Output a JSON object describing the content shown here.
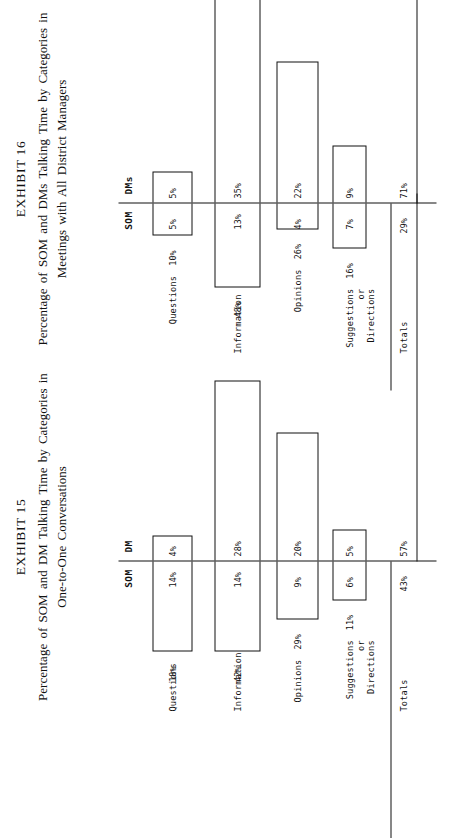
{
  "page": {
    "background": "#ffffff",
    "ink": "#111111",
    "orientation": "rotated-90-ccw"
  },
  "exhibits": [
    {
      "id": "exhibit-15",
      "number": "EXHIBIT 15",
      "subtitle": "Percentage of SOM and DM Talking Time by Categories in One-to-One Conversations",
      "headers": {
        "left": "SOM",
        "right": "DM"
      },
      "rows": [
        {
          "category": "Questions",
          "total": "18%",
          "som": "14%",
          "right": "4%"
        },
        {
          "category": "Information",
          "total": "42%",
          "som": "14%",
          "right": "28%"
        },
        {
          "category": "Opinions",
          "total": "29%",
          "som": "9%",
          "right": "20%"
        },
        {
          "category": "Suggestions or\nDirections",
          "total": "11%",
          "som": "6%",
          "right": "5%"
        }
      ],
      "totals": {
        "label": "Totals",
        "som": "43%",
        "right": "57%"
      }
    },
    {
      "id": "exhibit-16",
      "number": "EXHIBIT 16",
      "subtitle": "Percentage of SOM and DMs Talking Time by Categories in Meetings with All District Managers",
      "headers": {
        "left": "SOM",
        "right": "DMs"
      },
      "rows": [
        {
          "category": "Questions",
          "total": "10%",
          "som": "5%",
          "right": "5%"
        },
        {
          "category": "Information",
          "total": "48%",
          "som": "13%",
          "right": "35%"
        },
        {
          "category": "Opinions",
          "total": "26%",
          "som": "4%",
          "right": "22%"
        },
        {
          "category": "Suggestions or\nDirections",
          "total": "16%",
          "som": "7%",
          "right": "9%"
        }
      ],
      "totals": {
        "label": "Totals",
        "som": "29%",
        "right": "71%"
      }
    }
  ],
  "chart_data": [
    {
      "type": "bar",
      "title": "EXHIBIT 15 — Percentage of SOM and DM Talking Time by Categories in One-to-One Conversations",
      "orientation": "diverging-horizontal",
      "categories": [
        "Questions",
        "Information",
        "Opinions",
        "Suggestions or Directions"
      ],
      "series": [
        {
          "name": "SOM",
          "values": [
            14,
            14,
            9,
            6
          ]
        },
        {
          "name": "DM",
          "values": [
            4,
            28,
            20,
            5
          ]
        }
      ],
      "row_totals": [
        18,
        42,
        29,
        11
      ],
      "column_totals": {
        "SOM": 43,
        "DM": 57
      },
      "xlabel": "",
      "ylabel": "",
      "unit": "percent",
      "grid": false,
      "legend": "inline-axis-headers"
    },
    {
      "type": "bar",
      "title": "EXHIBIT 16 — Percentage of SOM and DMs Talking Time by Categories in Meetings with All District Managers",
      "orientation": "diverging-horizontal",
      "categories": [
        "Questions",
        "Information",
        "Opinions",
        "Suggestions or Directions"
      ],
      "series": [
        {
          "name": "SOM",
          "values": [
            5,
            13,
            4,
            7
          ]
        },
        {
          "name": "DMs",
          "values": [
            5,
            35,
            22,
            9
          ]
        }
      ],
      "row_totals": [
        10,
        48,
        26,
        16
      ],
      "column_totals": {
        "SOM": 29,
        "DMs": 71
      },
      "xlabel": "",
      "ylabel": "",
      "unit": "percent",
      "grid": false,
      "legend": "inline-axis-headers"
    }
  ]
}
